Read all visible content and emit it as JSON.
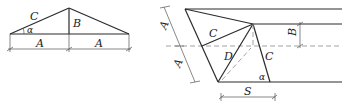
{
  "figure_left": {
    "labels": {
      "hyp": "C",
      "height": "B",
      "angle": "α",
      "half_left": "A",
      "half_right": "A"
    }
  },
  "figure_right": {
    "labels": {
      "side_a_upper": "A",
      "side_a_lower": "A",
      "offset": "B",
      "diag_c_left": "C",
      "diag_c_right": "C",
      "diag_d": "D",
      "angle": "α",
      "span": "S"
    }
  },
  "colors": {
    "line": "#2b2b2b",
    "dashed": "#999999",
    "background": "#ffffff"
  }
}
